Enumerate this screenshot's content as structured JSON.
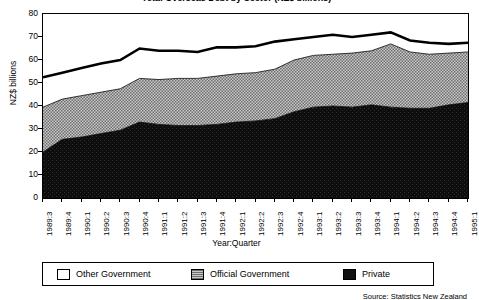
{
  "title": "Total Overseas Debt by Sector (NZ$ billions)",
  "source_note": "Source: Statistics New Zealand",
  "axes": {
    "ylabel": "NZ$ billions",
    "xlabel": "Year:Quarter",
    "yticks": [
      80,
      70,
      60,
      50,
      40,
      30,
      20,
      10,
      0
    ],
    "ymin": 0,
    "ymax": 80
  },
  "legend": {
    "items": [
      {
        "label": "Other Government",
        "color": "#ffffff",
        "fill": "white"
      },
      {
        "label": "Official Government",
        "color": "#9a9a9a",
        "fill": "gray-hatch"
      },
      {
        "label": "Private",
        "color": "#111111",
        "fill": "black"
      }
    ]
  },
  "chart_data": {
    "type": "area",
    "title": "Total Overseas Debt by Sector (NZ$ billions)",
    "xlabel": "Year:Quarter",
    "ylabel": "NZ$ billions",
    "ylim": [
      0,
      80
    ],
    "grid": false,
    "legend_position": "bottom",
    "stacked": true,
    "categories": [
      "1989:3",
      "1989:4",
      "1990:1",
      "1990:2",
      "1990:3",
      "1990:4",
      "1991:1",
      "1991:2",
      "1991:3",
      "1991:4",
      "1992:1",
      "1992:2",
      "1992:3",
      "1992:4",
      "1993:1",
      "1993:2",
      "1993:3",
      "1993:4",
      "1994:1",
      "1994:2",
      "1994:3",
      "1994:4",
      "1995:1"
    ],
    "series": [
      {
        "name": "Private",
        "values": [
          20.0,
          25.5,
          26.5,
          28.0,
          29.5,
          33.0,
          32.0,
          31.5,
          31.5,
          32.0,
          33.0,
          33.5,
          34.5,
          37.5,
          39.5,
          40.0,
          39.5,
          40.5,
          39.5,
          39.0,
          39.0,
          40.5,
          41.5
        ]
      },
      {
        "name": "Official Government",
        "values": [
          19.5,
          17.5,
          18.0,
          18.0,
          18.0,
          19.0,
          19.5,
          20.5,
          20.5,
          21.0,
          21.0,
          21.0,
          21.5,
          22.5,
          22.5,
          22.5,
          23.5,
          23.5,
          27.5,
          24.5,
          23.5,
          22.5,
          22.0
        ]
      },
      {
        "name": "Other Government",
        "values": [
          13.0,
          11.5,
          12.0,
          12.5,
          12.5,
          13.0,
          12.5,
          12.0,
          11.5,
          12.5,
          11.5,
          11.5,
          12.0,
          9.0,
          8.0,
          8.5,
          7.0,
          7.0,
          5.0,
          5.0,
          5.0,
          4.0,
          4.0
        ]
      }
    ],
    "totals": [
      52.5,
      54.5,
      56.5,
      58.5,
      60.0,
      65.0,
      64.0,
      64.0,
      63.5,
      65.5,
      65.5,
      66.0,
      68.0,
      69.0,
      70.0,
      71.0,
      70.0,
      71.0,
      72.0,
      68.5,
      67.5,
      67.0,
      67.5
    ]
  }
}
